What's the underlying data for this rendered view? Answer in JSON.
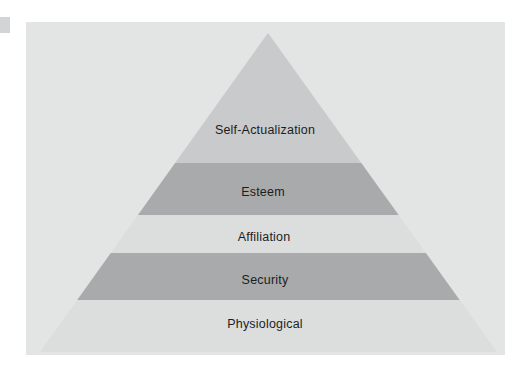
{
  "figure": {
    "type": "pyramid-diagram",
    "background_color": "#ffffff",
    "card_color": "#e3e4e4",
    "apex": {
      "x": 268,
      "y": 33
    },
    "base": {
      "left_x": 40,
      "right_x": 497,
      "y": 352
    },
    "tiers": [
      {
        "label": "Self-Actualization",
        "level": 5,
        "fill": "#c9cacb",
        "top_y": 33,
        "bottom_y": 163,
        "label_x": 265,
        "label_y": 130
      },
      {
        "label": "Esteem",
        "level": 4,
        "fill": "#a9aaab",
        "top_y": 163,
        "bottom_y": 215,
        "label_x": 263,
        "label_y": 192
      },
      {
        "label": "Affiliation",
        "level": 3,
        "fill": "#dcdddd",
        "top_y": 215,
        "bottom_y": 253,
        "label_x": 264,
        "label_y": 237
      },
      {
        "label": "Security",
        "level": 2,
        "fill": "#a9aaab",
        "top_y": 253,
        "bottom_y": 300,
        "label_x": 265,
        "label_y": 280
      },
      {
        "label": "Physiological",
        "level": 1,
        "fill": "#dcdddd",
        "top_y": 300,
        "bottom_y": 352,
        "label_x": 265,
        "label_y": 324
      }
    ]
  }
}
